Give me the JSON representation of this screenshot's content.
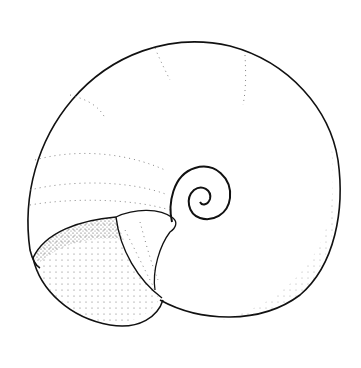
{
  "image": {
    "subject": "snail shell line drawing",
    "style": "pen and stipple illustration",
    "background": "#ffffff",
    "ink": "#111111"
  }
}
